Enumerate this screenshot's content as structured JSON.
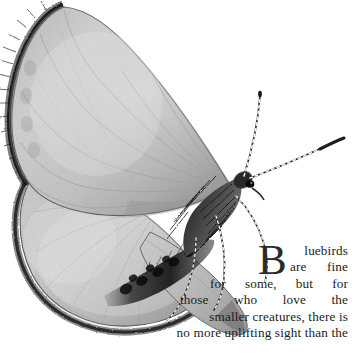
{
  "document": {
    "kind": "scanned-illustration-with-text",
    "background_color": "#ffffff",
    "width": 352,
    "height": 364
  },
  "illustration": {
    "subject": "butterfly",
    "style": "grayscale pencil drawing",
    "description": "Butterfly with large pale gray forewing and hindwing at upper left, dark fringed wing margins, furry thorax, banded antennae and legs extending to the right",
    "palette": {
      "wing_light": "#d8d8d8",
      "wing_mid": "#b9b9b9",
      "wing_shadow": "#8e8e8e",
      "fringe_dark": "#2f2f2f",
      "body_dark": "#1f1f1f",
      "outline": "#4a4a4a"
    }
  },
  "body_text": {
    "dropcap": "B",
    "lines": [
      "luebirds",
      "are fine",
      "for some, but for",
      "those who love the",
      "smaller creatures, there is",
      "no more uplifting sight than the"
    ],
    "full_text": "Bluebirds are fine for some, but for those who love the smaller creatures, there is no more uplifting sight than the",
    "alignment": "justified-right",
    "color": "#1c1c1c"
  }
}
